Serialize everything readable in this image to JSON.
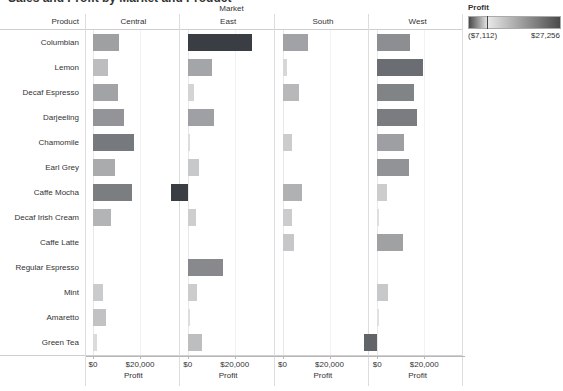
{
  "title": "Sales and Profit by Market and Product",
  "market_header": "Market",
  "product_header": "Product",
  "axis": {
    "title": "Profit",
    "ticks": [
      "$0",
      "$20,000"
    ],
    "tick_values": [
      0,
      20000
    ],
    "min": -10000,
    "max": 30000
  },
  "legend": {
    "title": "Profit",
    "min_label": "($7,112)",
    "max_label": "$27,256",
    "min_value": -7112,
    "max_value": 27256,
    "low_color": "#4a4a4a",
    "mid_color": "#e8e8e8",
    "high_color": "#4a4a4a"
  },
  "chart_data": {
    "type": "bar",
    "title": "Sales and Profit by Market and Product",
    "xlabel": "Profit",
    "ylabel": "Product",
    "grid": true,
    "legend_position": "top-right",
    "panel_by": "Market",
    "panels": [
      "Central",
      "East",
      "South",
      "West"
    ],
    "categories": [
      "Columbian",
      "Lemon",
      "Decaf Espresso",
      "Darjeeling",
      "Chamomile",
      "Earl Grey",
      "Caffe Mocha",
      "Decaf Irish Cream",
      "Caffe Latte",
      "Regular Espresso",
      "Mint",
      "Amaretto",
      "Green Tea"
    ],
    "xlim": [
      -10000,
      30000
    ],
    "series": [
      {
        "name": "Central",
        "values": [
          11200,
          6400,
          10600,
          13200,
          17600,
          9300,
          16800,
          7800,
          0,
          0,
          4100,
          5600,
          1500
        ]
      },
      {
        "name": "East",
        "values": [
          27256,
          10300,
          2600,
          11100,
          1100,
          4600,
          -7112,
          3600,
          0,
          14900,
          3900,
          1100,
          6200
        ]
      },
      {
        "name": "South",
        "values": [
          10800,
          2100,
          7200,
          0,
          4000,
          0,
          8300,
          4000,
          4800,
          0,
          0,
          0,
          0
        ]
      },
      {
        "name": "West",
        "values": [
          14100,
          19600,
          15800,
          17000,
          11300,
          13300,
          4000,
          800,
          11000,
          0,
          4600,
          700,
          -5500
        ]
      }
    ]
  }
}
